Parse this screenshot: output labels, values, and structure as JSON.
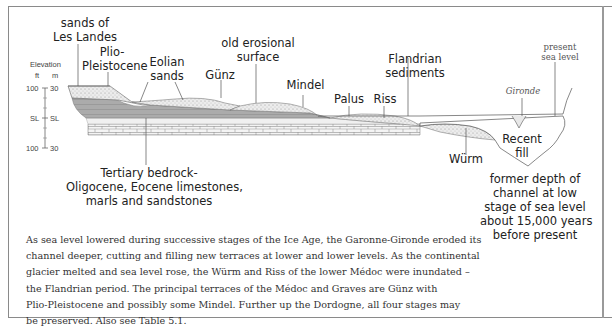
{
  "figure": {
    "elevation_axis": {
      "title": "Elevation",
      "units": [
        "ft",
        "m"
      ],
      "ticks_ft": [
        "100",
        "SL",
        "100"
      ],
      "ticks_m": [
        "30",
        "SL",
        "30"
      ]
    },
    "labels": {
      "sands_les_landes": [
        "sands of",
        "Les Landes"
      ],
      "plio_pleistocene": [
        "Plio-",
        "Pleistocene"
      ],
      "eolian_sands": [
        "Eolian",
        "sands"
      ],
      "gunz": "Günz",
      "old_erosional_surface": [
        "old erosional",
        "surface"
      ],
      "mindel": "Mindel",
      "palus": "Palus",
      "riss": "Riss",
      "flandrian_sediments": [
        "Flandrian",
        "sediments"
      ],
      "present_sea_level": [
        "present",
        "sea level"
      ],
      "gironde": "Gironde",
      "recent_fill": [
        "Recent",
        "fill"
      ],
      "wurm": "Würm",
      "tertiary_bedrock": [
        "Tertiary bedrock-",
        "Oligocene, Eocene limestones,",
        "marls and sandstones"
      ],
      "former_depth": [
        "former depth of",
        "channel at low",
        "stage of sea level",
        "about 15,000 years",
        "before present"
      ]
    },
    "caption_lines": [
      "As sea level lowered during successive stages of the Ice Age, the Garonne-Gironde eroded its",
      "channel deeper, cutting and filling new terraces at lower and lower levels. As the continental",
      "glacier melted and sea level rose, the Würm and Riss of the lower Médoc were inundated –",
      "the Flandrian period. The principal terraces of the Médoc and Graves are Günz with",
      "Plio-Pleistocene and possibly some Mindel. Further up the Dordogne, all four stages may",
      "be preserved. Also see Table 5.1."
    ],
    "colors": {
      "bedrock_grey": "#a9a9a9",
      "sand_light": "#e6e6e6",
      "line": "#555555"
    }
  }
}
